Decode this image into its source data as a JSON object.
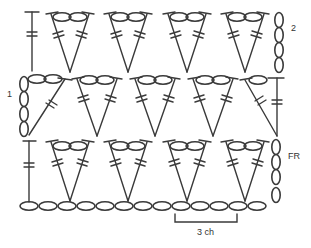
{
  "diagram": {
    "type": "crochet-chart",
    "stroke_color": "#3a3a3a",
    "row_labels": {
      "foundation_row": "FR",
      "row_1": "1",
      "row_2": "2"
    },
    "repeat_bracket_label": "3 ch",
    "legend": {
      "chain": "oval",
      "double_crochet": "post with two bars"
    },
    "foundation_chain_count": 14,
    "rows": [
      {
        "label": "FR",
        "shells": 4,
        "start": "dc",
        "end_turning_chain": 4
      },
      {
        "label": "1",
        "shells": 3,
        "half_shells": 2,
        "start_turning_chain": 4,
        "end": "dc"
      },
      {
        "label": "2",
        "shells": 4,
        "start": "dc",
        "end_turning_chain": 4
      }
    ]
  }
}
